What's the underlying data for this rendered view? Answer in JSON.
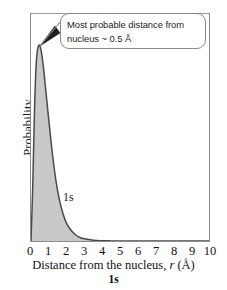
{
  "chart_data": {
    "type": "area",
    "title": "",
    "xlabel": "Distance from the nucleus, r (Å)",
    "xlabel_prefix": "Distance from the nucleus, ",
    "xlabel_var": "r",
    "xlabel_suffix": " (Å)",
    "ylabel": "Probability",
    "caption": "1s",
    "series_label": "1s",
    "xlim": [
      0,
      10
    ],
    "ylim": [
      0,
      1
    ],
    "xticks": [
      "0",
      "1",
      "2",
      "3",
      "4",
      "5",
      "6",
      "7",
      "8",
      "9",
      "10"
    ],
    "yticks": [],
    "grid": false,
    "legend": "none",
    "fill_color": "#c8c8c8",
    "line_color": "#4a4a4a",
    "frame_color": "#8d8d8d",
    "x": [
      0,
      0.1,
      0.2,
      0.3,
      0.4,
      0.5,
      0.6,
      0.7,
      0.8,
      0.9,
      1.0,
      1.2,
      1.4,
      1.6,
      1.8,
      2.0,
      2.25,
      2.5,
      2.75,
      3.0,
      3.5,
      4.0,
      4.5,
      5.0,
      6.0,
      7.0,
      8.0,
      9.0,
      10.0
    ],
    "y": [
      0.0,
      0.29,
      0.68,
      0.92,
      0.995,
      1.0,
      0.96,
      0.89,
      0.8,
      0.71,
      0.62,
      0.45,
      0.31,
      0.21,
      0.14,
      0.09,
      0.055,
      0.032,
      0.018,
      0.011,
      0.004,
      0.0015,
      0.0006,
      0.0002,
      0.0,
      0.0,
      0.0,
      0.0,
      0.0
    ],
    "annotations": [
      {
        "name": "most-probable-distance-callout",
        "text_line1": "Most probable distance from",
        "text_line2": "nucleus ~ 0.5 Å",
        "points_to_x": 0.5,
        "points_to_y": 1.0
      }
    ]
  },
  "figure": {
    "ylabel": "Probability",
    "xlabel_prefix": "Distance from the nucleus, ",
    "xlabel_var": "r",
    "xlabel_suffix": " (Å)",
    "caption": "1s",
    "orbital_tag": "1s",
    "callout_line1": "Most probable distance from",
    "callout_line2": "nucleus ~ 0.5 Å"
  }
}
